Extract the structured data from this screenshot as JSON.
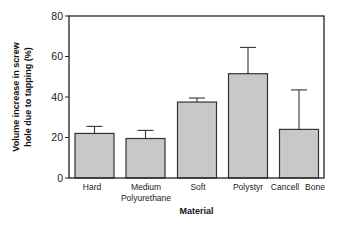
{
  "chart_data": {
    "type": "bar",
    "title": "",
    "xlabel": "Material",
    "ylabel_lines": [
      "Volume increase in screw",
      "hole due to tapping (%)"
    ],
    "ylabel": "Volume increase in screw hole due to tapping (%)",
    "ylim": [
      0,
      80
    ],
    "yticks": [
      0,
      20,
      40,
      60,
      80
    ],
    "grid": false,
    "legend": null,
    "categories": [
      "Hard",
      "Medium Polyurethane",
      "Soft",
      "Polystyr",
      "Cancell Bone"
    ],
    "category_label_lines": [
      [
        "Hard"
      ],
      [
        "Medium",
        "Polyurethane"
      ],
      [
        "Soft"
      ],
      [
        "Polystyr"
      ],
      [
        "Cancell",
        "Bone"
      ]
    ],
    "values": [
      22,
      19.5,
      37.5,
      51.5,
      24
    ],
    "error_upper": [
      25.5,
      23.5,
      39.5,
      64.5,
      43.5
    ],
    "bar_color": "#c8c8c8",
    "edge_color": "#333333"
  }
}
